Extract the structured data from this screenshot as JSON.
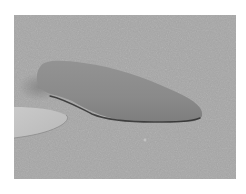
{
  "image": {
    "description": "Grayscale photograph of an elongated rounded object resting on a speckled gray surface, with a lighter pale blade-like shape entering from the left edge",
    "colors": {
      "border": "#ffffff",
      "surface": "#a6a6a6",
      "object": "#8c8c8c",
      "object_shadow": "#3a3a3a",
      "blade": "#c4c4c4"
    }
  }
}
